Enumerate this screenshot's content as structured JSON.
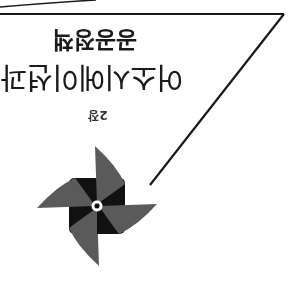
{
  "page": {
    "orientation": "rotated 180 degrees",
    "chapter_label": "2장",
    "title_line1": "어소시에이션과",
    "title_line2": "공공정책",
    "icon": "pinwheel-icon"
  },
  "colors": {
    "background": "#ffffff",
    "text": "#1a1a1a",
    "line": "#1a1a1a",
    "pinwheel_light": "#5a5a5a",
    "pinwheel_dark": "#111111"
  }
}
